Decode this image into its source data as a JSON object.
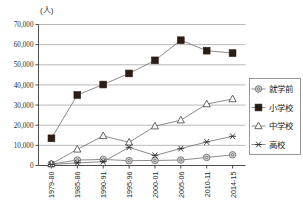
{
  "chart_data": {
    "type": "line",
    "title": "",
    "subtitle": "",
    "unit_label": "(人)",
    "xlabel": "",
    "ylabel": "",
    "ylim": [
      0,
      70000
    ],
    "ytick_values": [
      0,
      10000,
      20000,
      30000,
      40000,
      50000,
      60000,
      70000
    ],
    "ytick_labels": [
      "0",
      "10,000",
      "20,000",
      "30,000",
      "40,000",
      "50,000",
      "60,000",
      "70,000"
    ],
    "grid": true,
    "legend_position": "right",
    "categories": [
      "1979-80",
      "1985-86",
      "1990-91",
      "1995-96",
      "2000-01",
      "2005-06",
      "2010-11",
      "2014-15"
    ],
    "series": [
      {
        "name": "就学前",
        "marker": "circle-gray",
        "values": [
          700,
          2700,
          3000,
          2400,
          2500,
          2700,
          4000,
          5300
        ]
      },
      {
        "name": "小学校",
        "marker": "square-filled",
        "values": [
          13500,
          35000,
          40200,
          45700,
          52200,
          62200,
          57000,
          55800
        ]
      },
      {
        "name": "中学校",
        "marker": "triangle-open",
        "values": [
          800,
          8000,
          14700,
          11500,
          19500,
          22500,
          30500,
          33000
        ]
      },
      {
        "name": "高校",
        "marker": "asterisk",
        "values": [
          500,
          1300,
          1900,
          9000,
          5000,
          8400,
          11700,
          14500
        ]
      }
    ]
  },
  "legend": {
    "items": [
      {
        "label": "就学前"
      },
      {
        "label": "小学校"
      },
      {
        "label": "中学校"
      },
      {
        "label": "高校"
      }
    ]
  }
}
